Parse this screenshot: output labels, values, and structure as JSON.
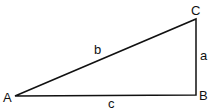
{
  "diagram": {
    "type": "right-triangle",
    "vertices": [
      {
        "label": "A",
        "x": 15,
        "y": 96
      },
      {
        "label": "B",
        "x": 196,
        "y": 95
      },
      {
        "label": "C",
        "x": 196,
        "y": 19
      }
    ],
    "sides": [
      {
        "label": "a",
        "between": "B-C"
      },
      {
        "label": "b",
        "between": "A-C"
      },
      {
        "label": "c",
        "between": "A-B"
      }
    ],
    "labels": {
      "A": "A",
      "B": "B",
      "C": "C",
      "a": "a",
      "b": "b",
      "c": "c"
    },
    "stroke_color": "#111111"
  }
}
